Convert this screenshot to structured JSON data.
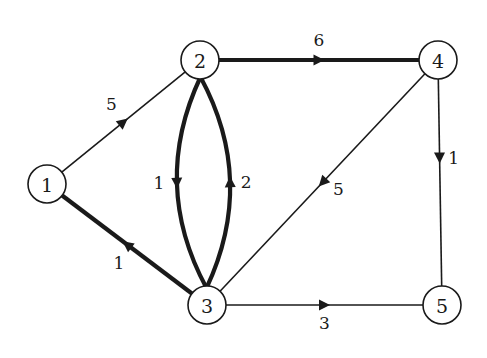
{
  "diagram": {
    "type": "directed-weighted-graph",
    "colors": {
      "ink": "#1a1a1a",
      "background": "#ffffff"
    },
    "nodes": [
      {
        "id": "1",
        "label": "1"
      },
      {
        "id": "2",
        "label": "2"
      },
      {
        "id": "3",
        "label": "3"
      },
      {
        "id": "4",
        "label": "4"
      },
      {
        "id": "5",
        "label": "5"
      }
    ],
    "edges": [
      {
        "from": "1",
        "to": "2",
        "weight": "5",
        "highlighted": false
      },
      {
        "from": "2",
        "to": "4",
        "weight": "6",
        "highlighted": true
      },
      {
        "from": "2",
        "to": "3",
        "weight": "1",
        "highlighted": true
      },
      {
        "from": "3",
        "to": "2",
        "weight": "2",
        "highlighted": true
      },
      {
        "from": "3",
        "to": "1",
        "weight": "1",
        "highlighted": true
      },
      {
        "from": "4",
        "to": "3",
        "weight": "5",
        "highlighted": false
      },
      {
        "from": "4",
        "to": "5",
        "weight": "1",
        "highlighted": false
      },
      {
        "from": "3",
        "to": "5",
        "weight": "3",
        "highlighted": false
      }
    ]
  }
}
